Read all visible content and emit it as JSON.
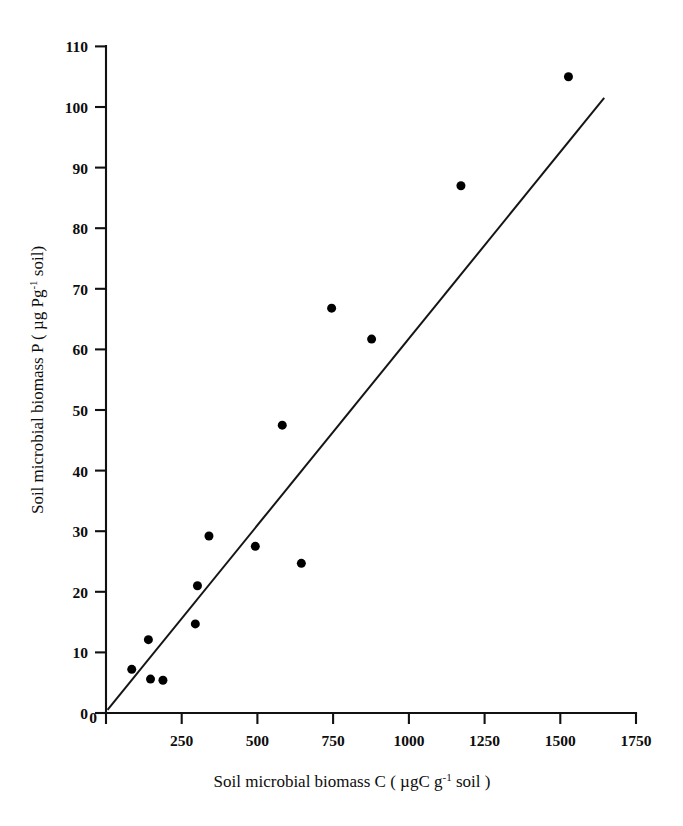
{
  "figure": {
    "title": "",
    "background_color": "#ffffff",
    "ink_color": "#000000"
  },
  "axes": {
    "x": {
      "label_prefix": "Soil microbial biomass C ( ",
      "label_unit_main": "µgC g",
      "label_unit_sup": "-1",
      "label_suffix": " soil )",
      "label_full": "Soil microbial biomass C ( µgC g-1 soil )",
      "ticks": [
        "0",
        "250",
        "500",
        "750",
        "1000",
        "1250",
        "1500",
        "1750"
      ],
      "min": 0,
      "max": 1750,
      "tick_interval": 250
    },
    "y": {
      "label_prefix": "Soil microbial biomass P ( ",
      "label_unit_main": "µg Pg",
      "label_unit_sup": "-1",
      "label_suffix": " soil)",
      "label_full": "Soil microbial biomass P ( µg Pg-1 soil)",
      "ticks": [
        "0",
        "10",
        "20",
        "30",
        "40",
        "50",
        "60",
        "70",
        "80",
        "90",
        "100",
        "110"
      ],
      "min": 0,
      "max": 110,
      "tick_interval": 10
    }
  },
  "chart_data": {
    "type": "scatter",
    "title": "",
    "xlabel": "Soil microbial biomass C ( µgC g-1 soil )",
    "ylabel": "Soil microbial biomass P ( µg Pg-1 soil)",
    "xlim": [
      0,
      1750
    ],
    "ylim": [
      0,
      110
    ],
    "xticks": [
      0,
      250,
      500,
      750,
      1000,
      1250,
      1500,
      1750
    ],
    "yticks": [
      0,
      10,
      20,
      30,
      40,
      50,
      60,
      70,
      80,
      90,
      100,
      110
    ],
    "grid": false,
    "legend": null,
    "marker": "filled-circle",
    "marker_color": "#000000",
    "marker_size_px": 9,
    "points": [
      {
        "x": 85,
        "y": 7.2
      },
      {
        "x": 140,
        "y": 12.1
      },
      {
        "x": 147,
        "y": 5.6
      },
      {
        "x": 188,
        "y": 5.4
      },
      {
        "x": 295,
        "y": 14.7
      },
      {
        "x": 302,
        "y": 21.0
      },
      {
        "x": 340,
        "y": 29.2
      },
      {
        "x": 493,
        "y": 27.5
      },
      {
        "x": 582,
        "y": 47.5
      },
      {
        "x": 645,
        "y": 24.7
      },
      {
        "x": 745,
        "y": 66.8
      },
      {
        "x": 877,
        "y": 61.7
      },
      {
        "x": 1172,
        "y": 87.0
      },
      {
        "x": 1527,
        "y": 105.0
      }
    ],
    "fit_line": {
      "style": "solid",
      "color": "#151515",
      "x_start": 5,
      "y_start": 0.5,
      "x_end": 1645,
      "y_end": 101.5
    }
  }
}
